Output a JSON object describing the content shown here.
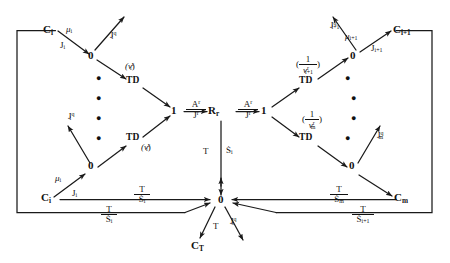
{
  "diagram": {
    "type": "bond-graph",
    "stroke_color": "#1a1a1a",
    "background": "#ffffff",
    "nodes": {
      "c_i_top": "C",
      "c_i_top_sub": "i",
      "zero_top_left": "0",
      "td_top_left": "TD",
      "one_left": "1",
      "r_center": "R",
      "r_center_sub": "r",
      "one_right": "1",
      "td_top_right": "TD",
      "zero_top_right": "0",
      "c_i1_top": "C",
      "c_i1_top_sub": "i+1",
      "zero_mid_left": "0",
      "td_bot_left": "TD",
      "c_i_bot": "C",
      "c_i_bot_sub": "i",
      "td_bot_right": "TD",
      "zero_mid_right": "0",
      "c_m": "C",
      "c_m_sub": "m",
      "zero_bottom": "0",
      "c_t": "C",
      "c_t_sub": "T"
    },
    "edge_labels": {
      "mu_i_top": {
        "sym": "μ",
        "sub": "i"
      },
      "j_i_top": {
        "sym": "J",
        "sub": "i"
      },
      "jq_i_top": {
        "sym": "J",
        "sub": "i",
        "sup": "q"
      },
      "nu_i_r_top": {
        "text": "(ν",
        "sub": "i",
        "sup": "r",
        "tail": ")"
      },
      "a_r_left_num": "A",
      "a_r_left_num_sup": "r",
      "j_r_left_den": "J",
      "j_r_left_den_sup": "r",
      "a_r_right_num": "A",
      "a_r_right_num_sup": "r",
      "j_r_right_den": "J",
      "j_r_right_den_sup": "r",
      "mu_i1": {
        "sym": "μ",
        "sub": "i+1"
      },
      "j_i1": {
        "sym": "J",
        "sub": "i+1"
      },
      "jq_i1": {
        "sym": "J",
        "sub": "i+1",
        "sup": "q"
      },
      "inv_nu_i1_num": "1",
      "inv_nu_i1_den_sym": "ν",
      "inv_nu_i1_den_sub": "i+1",
      "inv_nu_i1_den_sup": "r",
      "inv_nu_m_num": "1",
      "inv_nu_m_den_sym": "ν",
      "inv_nu_m_den_sub": "m",
      "inv_nu_m_den_sup": "r",
      "mu_i_bot": {
        "sym": "μ",
        "sub": "i"
      },
      "j_i_bot": {
        "sym": "J",
        "sub": "i"
      },
      "jq_i_bot": {
        "sym": "J",
        "sub": "i",
        "sup": "q"
      },
      "nu_i_r_bot": {
        "text": "(ν",
        "sub": "i",
        "sup": "r",
        "tail": ")"
      },
      "jq_m": {
        "sym": "J",
        "sub": "m",
        "sup": "q"
      },
      "t_sdot_i_center_num": "T",
      "t_sdot_i_center_den_sym": "Ṡ",
      "t_sdot_i_center_den_sub": "i",
      "t_sdot_i_row_num": "T",
      "t_sdot_i_row_den_sym": "Ṡ",
      "t_sdot_i_row_den_sub": "i",
      "t_sdot_i_outer_num": "T",
      "t_sdot_i_outer_den_sym": "Ṡ",
      "t_sdot_i_outer_den_sub": "i",
      "t_sdot_m_row_num": "T",
      "t_sdot_m_row_den_sym": "Ṡ",
      "t_sdot_m_row_den_sub": "m",
      "t_sdot_i1_outer_num": "T",
      "t_sdot_i1_outer_den_sym": "Ṡ",
      "t_sdot_i1_outer_den_sub": "i+1",
      "t_bottom": "T",
      "jq_s_bottom": {
        "sym": "J",
        "sub": "s",
        "sup": "q"
      }
    },
    "ellipsis_note": "vertical dot columns indicating repeated compartments"
  }
}
